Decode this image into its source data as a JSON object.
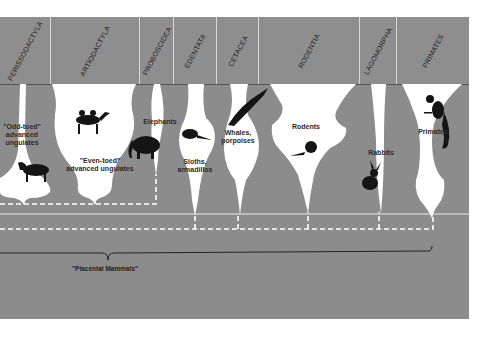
{
  "orders": [
    {
      "name": "PERISSODACTYLA",
      "x": 0,
      "w": 51
    },
    {
      "name": "ARTIODACTYLA",
      "x": 51,
      "w": 89
    },
    {
      "name": "PROBOSCIDEA",
      "x": 140,
      "w": 34
    },
    {
      "name": "EDENTATA",
      "x": 174,
      "w": 43
    },
    {
      "name": "CETACEA",
      "x": 217,
      "w": 42
    },
    {
      "name": "RODENTIA",
      "x": 259,
      "w": 101
    },
    {
      "name": "LAGOMORPHA",
      "x": 360,
      "w": 37
    },
    {
      "name": "PRIMATES",
      "x": 397,
      "w": 72
    }
  ],
  "labels": {
    "odd_toed": "\"Odd-toed\"\nadvanced\nungulates",
    "even_toed": "\"Even-toed\"\nadvanced ungulates",
    "elephants": "Elephants",
    "sloths": "Sloths,\narmadillos",
    "whales": "Whales,\nporpoises",
    "rodents": "Rodents",
    "rabbits": "Rabbits",
    "primates": "Primates"
  },
  "caption": "\"Placental Mammals\"",
  "colors": {
    "background": "#8c8c8c",
    "shape_fill": "#ffffff",
    "lines": "#ffffff",
    "text": "#2a2a2a"
  }
}
